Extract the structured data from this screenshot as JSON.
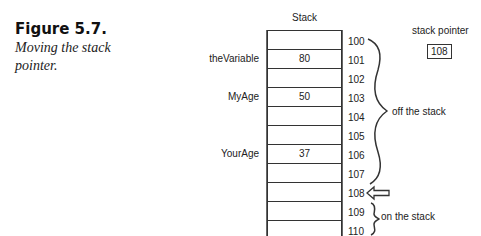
{
  "figure": {
    "title": "Figure 5.7.",
    "caption": "Moving the stack pointer."
  },
  "stack": {
    "title": "Stack",
    "cells": [
      {
        "address": "100",
        "value": "",
        "label": ""
      },
      {
        "address": "101",
        "value": "80",
        "label": "theVariable"
      },
      {
        "address": "102",
        "value": "",
        "label": ""
      },
      {
        "address": "103",
        "value": "50",
        "label": "MyAge"
      },
      {
        "address": "104",
        "value": "",
        "label": ""
      },
      {
        "address": "105",
        "value": "",
        "label": ""
      },
      {
        "address": "106",
        "value": "37",
        "label": "YourAge"
      },
      {
        "address": "107",
        "value": "",
        "label": ""
      },
      {
        "address": "108",
        "value": "",
        "label": ""
      },
      {
        "address": "109",
        "value": "",
        "label": ""
      },
      {
        "address": "110",
        "value": "",
        "label": ""
      }
    ]
  },
  "stack_pointer": {
    "label": "stack pointer",
    "value": "108"
  },
  "annotations": {
    "off_stack": "off the stack",
    "on_stack": "on the stack"
  }
}
